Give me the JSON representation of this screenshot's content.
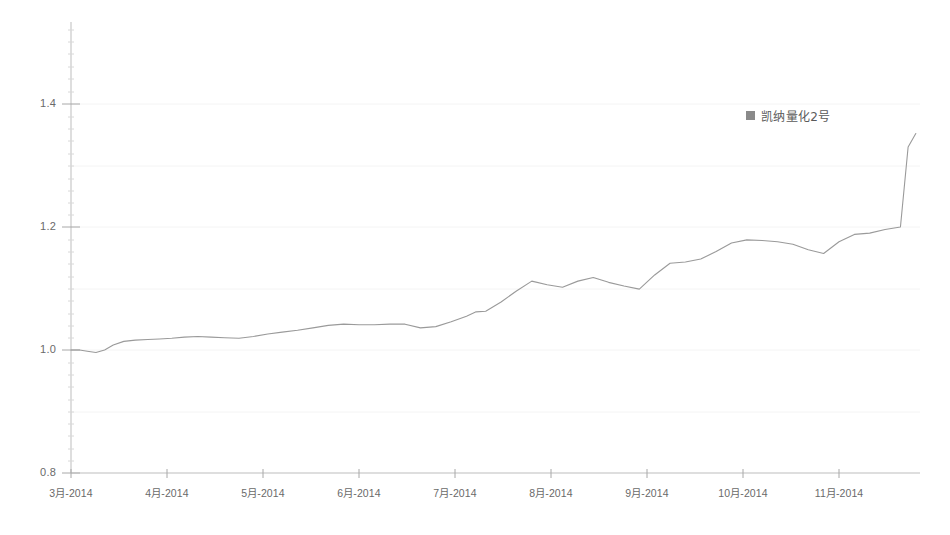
{
  "chart_data": {
    "type": "line",
    "title": "",
    "subtitle": "",
    "xlabel": "",
    "ylabel": "",
    "ylim": [
      0.8,
      1.45
    ],
    "yticks": [
      "0.8",
      "1.0",
      "1.2",
      "1.4"
    ],
    "ytick_values": [
      0.8,
      1.0,
      1.2,
      1.4
    ],
    "grid": "faint-horizontal",
    "legend_position": "top-right-inside",
    "legend": [
      "凯纳量化2号"
    ],
    "categories": [
      "3月-2014",
      "4月-2014",
      "5月-2014",
      "6月-2014",
      "7月-2014",
      "8月-2014",
      "9月-2014",
      "10月-2014",
      "11月-2014"
    ],
    "xtick_labels": [
      "3月-2014",
      "4月-2014",
      "5月-2014",
      "6月-2014",
      "7月-2014",
      "8月-2014",
      "9月-2014",
      "10月-2014",
      "11月-2014"
    ],
    "series": [
      {
        "name": "凯纳量化2号",
        "color": "#9a9a9a",
        "x": [
          0.0,
          0.09,
          0.17,
          0.26,
          0.35,
          0.44,
          0.55,
          0.67,
          0.8,
          0.92,
          1.05,
          1.18,
          1.32,
          1.46,
          1.6,
          1.75,
          1.9,
          2.05,
          2.2,
          2.36,
          2.52,
          2.68,
          2.84,
          3.0,
          3.16,
          3.32,
          3.48,
          3.64,
          3.8,
          3.96,
          4.12,
          4.22,
          4.32,
          4.48,
          4.64,
          4.8,
          4.96,
          5.12,
          5.28,
          5.44,
          5.6,
          5.76,
          5.92,
          6.08,
          6.24,
          6.4,
          6.56,
          6.72,
          6.88,
          7.04,
          7.2,
          7.36,
          7.52,
          7.68,
          7.84,
          8.0,
          8.16,
          8.32,
          8.48,
          8.64,
          8.72,
          8.8
        ],
        "values": [
          1.0,
          1.0,
          0.998,
          0.996,
          1.0,
          1.008,
          1.014,
          1.016,
          1.017,
          1.018,
          1.019,
          1.021,
          1.022,
          1.021,
          1.02,
          1.019,
          1.022,
          1.026,
          1.029,
          1.032,
          1.036,
          1.04,
          1.042,
          1.041,
          1.041,
          1.042,
          1.042,
          1.036,
          1.038,
          1.046,
          1.055,
          1.062,
          1.063,
          1.078,
          1.096,
          1.112,
          1.106,
          1.102,
          1.112,
          1.118,
          1.11,
          1.104,
          1.099,
          1.122,
          1.141,
          1.143,
          1.148,
          1.16,
          1.174,
          1.179,
          1.178,
          1.176,
          1.172,
          1.163,
          1.157,
          1.176,
          1.188,
          1.19,
          1.196,
          1.2,
          1.33,
          1.352
        ]
      }
    ],
    "annotations": []
  },
  "legend": {
    "series_label": "凯纳量化2号",
    "marker": "square-swatch",
    "marker_color": "#8a8a8a"
  },
  "axes": {
    "y_labels": [
      "1.4",
      "1.2",
      "1.0",
      "0.8"
    ],
    "x_labels": [
      "3月-2014",
      "4月-2014",
      "5月-2014",
      "6月-2014",
      "7月-2014",
      "8月-2014",
      "9月-2014",
      "10月-2014",
      "11月-2014"
    ]
  },
  "colors": {
    "line": "#9a9a9a",
    "axis": "#b5b5b5",
    "grid": "#f2f2f2",
    "text": "#6a6a6a",
    "background": "#ffffff"
  }
}
